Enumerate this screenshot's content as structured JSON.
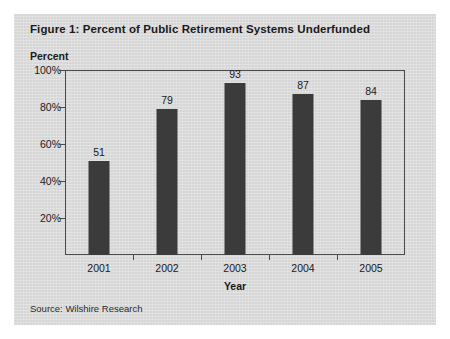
{
  "figure": {
    "title": "Figure 1: Percent of Public Retirement Systems Underfunded",
    "source_note": "Source: Wilshire Research",
    "card_background": "#dcdcdc",
    "bar_color": "#3b3b3b",
    "axis_color": "#4a4a4a",
    "text_color": "#1a1a1a"
  },
  "chart_data": {
    "type": "bar",
    "title": "Figure 1: Percent of Public Retirement Systems Underfunded",
    "categories": [
      "2001",
      "2002",
      "2003",
      "2004",
      "2005"
    ],
    "values": [
      51,
      79,
      93,
      87,
      84
    ],
    "value_labels": [
      "51",
      "79",
      "93",
      "87",
      "84"
    ],
    "xlabel": "Year",
    "ylabel": "Percent",
    "ylim": [
      0,
      100
    ],
    "yticks": [
      100,
      80,
      60,
      40,
      20
    ],
    "ytick_labels": [
      "100%",
      "80%",
      "60%",
      "40%",
      "20%"
    ],
    "grid": false,
    "legend": false
  }
}
